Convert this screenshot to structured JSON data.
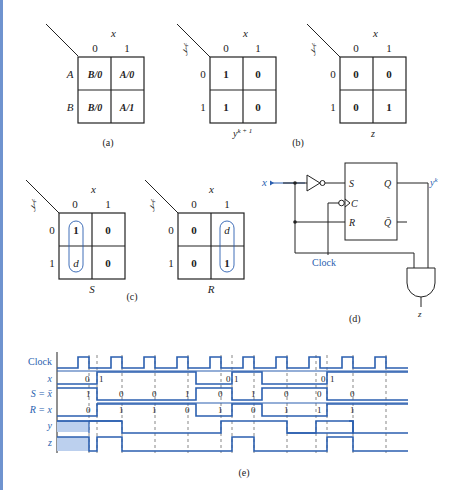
{
  "figure": {
    "panel_a": {
      "caption": "(a)",
      "col_var": "x",
      "col_headers": [
        "0",
        "1"
      ],
      "row_headers": [
        "A",
        "B"
      ],
      "cells": [
        [
          "B/0",
          "A/0"
        ],
        [
          "B/0",
          "A/1"
        ]
      ]
    },
    "panel_b": {
      "caption": "(b)",
      "map1": {
        "col_var": "x",
        "row_var": "y^k",
        "col_headers": [
          "0",
          "1"
        ],
        "row_headers": [
          "0",
          "1"
        ],
        "cells": [
          [
            "1",
            "0"
          ],
          [
            "1",
            "0"
          ]
        ],
        "label": "y^(k+1)"
      },
      "map2": {
        "col_var": "x",
        "row_var": "y^k",
        "col_headers": [
          "0",
          "1"
        ],
        "row_headers": [
          "0",
          "1"
        ],
        "cells": [
          [
            "0",
            "0"
          ],
          [
            "0",
            "1"
          ]
        ],
        "label": "z"
      }
    },
    "panel_c": {
      "caption": "(c)",
      "map_s": {
        "col_var": "x",
        "row_var": "y^k",
        "col_headers": [
          "0",
          "1"
        ],
        "row_headers": [
          "0",
          "1"
        ],
        "cells": [
          [
            "1",
            "0"
          ],
          [
            "d",
            "0"
          ]
        ],
        "label": "S",
        "group": "column 0"
      },
      "map_r": {
        "col_var": "x",
        "row_var": "y^k",
        "col_headers": [
          "0",
          "1"
        ],
        "row_headers": [
          "0",
          "1"
        ],
        "cells": [
          [
            "0",
            "d"
          ],
          [
            "0",
            "1"
          ]
        ],
        "label": "R",
        "group": "column 1"
      }
    },
    "panel_d": {
      "caption": "(d)",
      "input_label": "x",
      "output_label": "y^k",
      "clock_label": "Clock",
      "ff_pins": [
        "S",
        "C",
        "R",
        "Q",
        "Q̄"
      ],
      "gate": "AND",
      "gate_output": "z"
    },
    "panel_e": {
      "caption": "(e)",
      "signals": [
        "Clock",
        "x",
        "S = x̄",
        "R = x",
        "y",
        "z"
      ],
      "x_values": [
        "0",
        "1",
        "0",
        "1",
        "0",
        "1"
      ],
      "s_values": [
        "1",
        "0",
        "0",
        "1",
        "0",
        "1",
        "0",
        "0",
        "0"
      ],
      "r_values": [
        "0",
        "1",
        "1",
        "0",
        "1",
        "0",
        "1",
        "1",
        "1"
      ]
    },
    "colors": {
      "signal": "#2b5fb0",
      "shade": "#bcd0ee",
      "ink": "#222222",
      "edge": "#6f93cf"
    }
  }
}
